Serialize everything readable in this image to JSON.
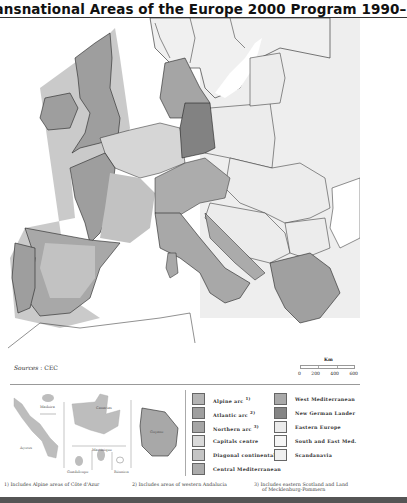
{
  "title": "Transnational Areas of the Europe 2000 Program 1990–1993",
  "sources": {
    "label": "Sources",
    "value": "CEC"
  },
  "scale": {
    "unit": "Km",
    "ticks": [
      "0",
      "200",
      "400",
      "600"
    ]
  },
  "insets": {
    "labels": [
      "Madeira",
      "Canarias",
      "Açores",
      "Guyane",
      "Martinique",
      "Guadeloupe",
      "Réunion"
    ]
  },
  "legend": {
    "items": [
      {
        "label": "Alpine arc",
        "note": "1)",
        "color": "#b4b4b4"
      },
      {
        "label": "Atlantic arc",
        "note": "2)",
        "color": "#9f9f9f"
      },
      {
        "label": "Northern arc",
        "note": "3)",
        "color": "#a5a5a5"
      },
      {
        "label": "Capitals centre",
        "note": "",
        "color": "#d9d9d9"
      },
      {
        "label": "Diagonal continental",
        "note": "",
        "color": "#c4c4c4"
      },
      {
        "label": "Central Mediterranean",
        "note": "",
        "color": "#ababab"
      },
      {
        "label": "West Mediterranean",
        "note": "",
        "color": "#a9a9a9"
      },
      {
        "label": "New German Lander",
        "note": "",
        "color": "#858585"
      },
      {
        "label": "Eastern Europe",
        "note": "",
        "color": "#ebebeb"
      },
      {
        "label": "South and East Med.",
        "note": "",
        "color": "#f6f6f6"
      },
      {
        "label": "Scandanavia",
        "note": "",
        "color": "#f0f0f0"
      }
    ]
  },
  "footnotes": [
    "1) Includes Alpine areas of Côte d'Azur",
    "2) Includes areas of western Andalucia",
    "3) Includes eastern Scotland and Land",
    "of Mecklenburg-Pommern"
  ],
  "map": {
    "colors": {
      "sea": "#ffffff",
      "outside": "#f3f3f3",
      "atlantic": "#9e9e9e",
      "capitals": "#d6d6d6",
      "diagonal": "#c2c2c2",
      "alpine": "#acacac",
      "new_german": "#828282",
      "eastern": "#ececec",
      "med": "#a8a8a8",
      "halo": "#bdbdbd",
      "border": "#222222"
    }
  }
}
